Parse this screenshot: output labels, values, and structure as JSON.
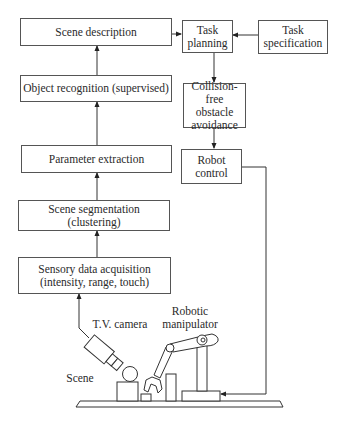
{
  "diagram": {
    "boxes": {
      "scene_description": "Scene description",
      "object_recognition": "Object recognition (supervised)",
      "parameter_extraction": "Parameter extraction",
      "scene_segmentation_line1": "Scene segmentation",
      "scene_segmentation_line2": "(clustering)",
      "sensory_line1": "Sensory data acquisition",
      "sensory_line2": "(intensity, range, touch)",
      "task_planning_line1": "Task",
      "task_planning_line2": "planning",
      "task_spec_line1": "Task",
      "task_spec_line2": "specification",
      "collision_line1": "Collision-free",
      "collision_line2": "obstacle",
      "collision_line3": "avoidance",
      "robot_control_line1": "Robot",
      "robot_control_line2": "control"
    },
    "labels": {
      "tv_camera": "T.V. camera",
      "robotic_line1": "Robotic",
      "robotic_line2": "manipulator",
      "scene": "Scene"
    },
    "edges": [
      {
        "from": "sensory_data_acquisition",
        "to": "scene_segmentation"
      },
      {
        "from": "scene_segmentation",
        "to": "parameter_extraction"
      },
      {
        "from": "parameter_extraction",
        "to": "object_recognition"
      },
      {
        "from": "object_recognition",
        "to": "scene_description"
      },
      {
        "from": "scene_description",
        "to": "task_planning"
      },
      {
        "from": "task_specification",
        "to": "task_planning"
      },
      {
        "from": "task_planning",
        "to": "collision_free_obstacle_avoidance"
      },
      {
        "from": "collision_free_obstacle_avoidance",
        "to": "robot_control"
      },
      {
        "from": "robot_control",
        "to": "robotic_manipulator"
      },
      {
        "from": "tv_camera",
        "to": "sensory_data_acquisition"
      }
    ]
  }
}
